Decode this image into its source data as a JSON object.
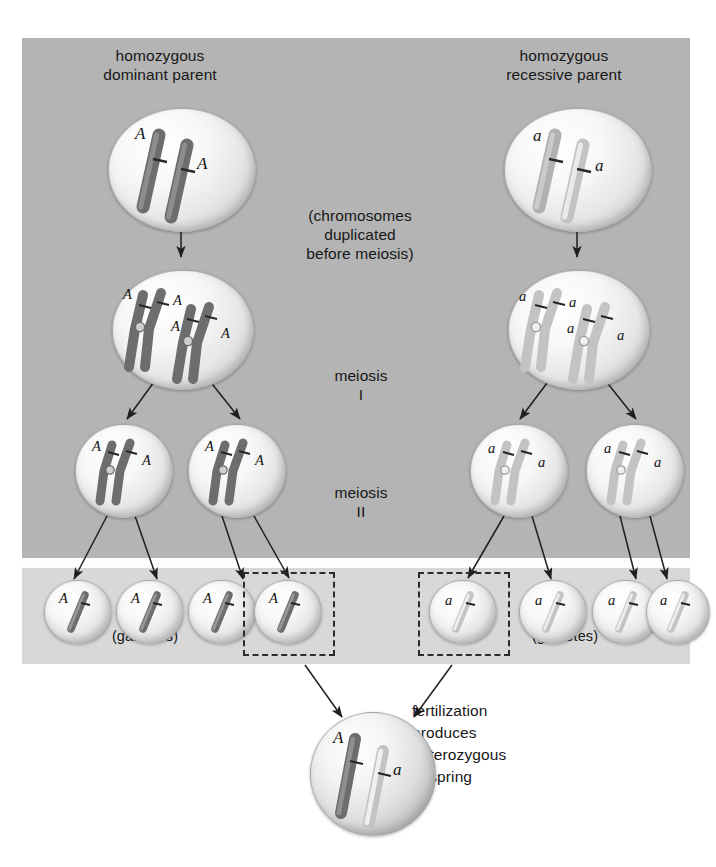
{
  "diagram": {
    "labels": {
      "parent_left": "homozygous\ndominant parent",
      "parent_right": "homozygous\nrecessive parent",
      "duplication_note": "(chromosomes\nduplicated\nbefore meiosis)",
      "meiosis_one": "meiosis\nI",
      "meiosis_two": "meiosis\nII",
      "gametes_left": "(gametes)",
      "gametes_right": "(gametes)",
      "fertilization": "fertilization\nproduces\nheterozygous\noffspring"
    },
    "alleles": {
      "dominant": "A",
      "recessive": "a"
    },
    "colors": {
      "panel_background": "#b4b4b4",
      "gametes_band": "#d8d8d8",
      "gap_band": "#fdfdfd",
      "page_background": "#ffffff",
      "chromosome_dominant": "#6f6f6f",
      "chromosome_recessive": "#c6c6c6",
      "text": "#171717",
      "selection_box": "#2b2b2b",
      "arrow": "#1f1f1f"
    },
    "rows": [
      {
        "name": "parent-cells",
        "stage": "diploid parent cell",
        "cells": [
          {
            "id": "parent-dominant",
            "alleles": [
              "A",
              "A"
            ],
            "chromosomes": 2,
            "form": "single",
            "shade": "dark"
          },
          {
            "id": "parent-recessive",
            "alleles": [
              "a",
              "a"
            ],
            "chromosomes": 2,
            "form": "single",
            "shade": "light"
          }
        ]
      },
      {
        "name": "duplicated-cells",
        "stage": "after chromosome duplication",
        "cells": [
          {
            "id": "duplicated-dominant",
            "alleles": [
              "A",
              "A",
              "A",
              "A"
            ],
            "chromosomes": 2,
            "form": "duplicated",
            "shade": "dark"
          },
          {
            "id": "duplicated-recessive",
            "alleles": [
              "a",
              "a",
              "a",
              "a"
            ],
            "chromosomes": 2,
            "form": "duplicated",
            "shade": "light"
          }
        ]
      },
      {
        "name": "meiosis-one-products",
        "stage": "after meiosis I",
        "cells": [
          {
            "id": "m1-dominant-1",
            "alleles": [
              "A",
              "A"
            ],
            "chromosomes": 1,
            "form": "duplicated",
            "shade": "dark"
          },
          {
            "id": "m1-dominant-2",
            "alleles": [
              "A",
              "A"
            ],
            "chromosomes": 1,
            "form": "duplicated",
            "shade": "dark"
          },
          {
            "id": "m1-recessive-1",
            "alleles": [
              "a",
              "a"
            ],
            "chromosomes": 1,
            "form": "duplicated",
            "shade": "light"
          },
          {
            "id": "m1-recessive-2",
            "alleles": [
              "a",
              "a"
            ],
            "chromosomes": 1,
            "form": "duplicated",
            "shade": "light"
          }
        ]
      },
      {
        "name": "gametes",
        "stage": "after meiosis II",
        "cells": [
          {
            "id": "gamete-A-1",
            "alleles": [
              "A"
            ],
            "chromosomes": 1,
            "form": "single",
            "shade": "dark",
            "selected": false
          },
          {
            "id": "gamete-A-2",
            "alleles": [
              "A"
            ],
            "chromosomes": 1,
            "form": "single",
            "shade": "dark",
            "selected": false
          },
          {
            "id": "gamete-A-3",
            "alleles": [
              "A"
            ],
            "chromosomes": 1,
            "form": "single",
            "shade": "dark",
            "selected": false
          },
          {
            "id": "gamete-A-4",
            "alleles": [
              "A"
            ],
            "chromosomes": 1,
            "form": "single",
            "shade": "dark",
            "selected": true
          },
          {
            "id": "gamete-a-1",
            "alleles": [
              "a"
            ],
            "chromosomes": 1,
            "form": "single",
            "shade": "light",
            "selected": true
          },
          {
            "id": "gamete-a-2",
            "alleles": [
              "a"
            ],
            "chromosomes": 1,
            "form": "single",
            "shade": "light",
            "selected": false
          },
          {
            "id": "gamete-a-3",
            "alleles": [
              "a"
            ],
            "chromosomes": 1,
            "form": "single",
            "shade": "light",
            "selected": false
          },
          {
            "id": "gamete-a-4",
            "alleles": [
              "a"
            ],
            "chromosomes": 1,
            "form": "single",
            "shade": "light",
            "selected": false
          }
        ]
      },
      {
        "name": "zygote",
        "stage": "fertilized offspring",
        "cells": [
          {
            "id": "zygote-Aa",
            "alleles": [
              "A",
              "a"
            ],
            "chromosomes": 2,
            "form": "single",
            "shade": "mixed"
          }
        ]
      }
    ]
  }
}
